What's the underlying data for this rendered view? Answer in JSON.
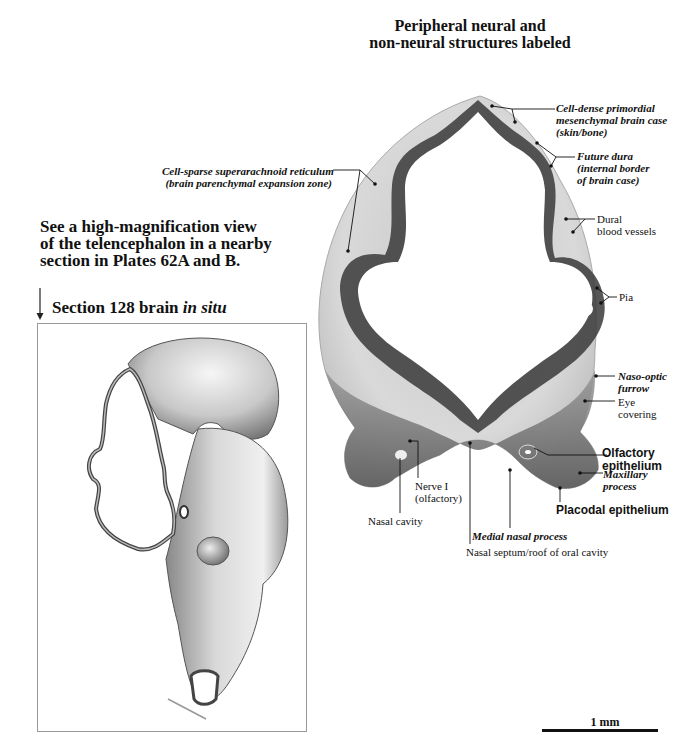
{
  "figure": {
    "title_line1": "Peripheral neural and",
    "title_line2": "non-neural structures labeled",
    "note_line1": "See a high-magnification view",
    "note_line2": "of the telencephalon in a nearby",
    "note_line3": "section in Plates 62A and B.",
    "inset": {
      "label_prefix": "Section 128 brain ",
      "label_italic": "in situ"
    },
    "scale_bar": {
      "label": "1 mm"
    }
  },
  "labels": {
    "cell_dense_1": "Cell-dense primordial",
    "cell_dense_2": "mesenchymal brain case",
    "cell_dense_3": "(skin/bone)",
    "future_dura_1": "Future dura",
    "future_dura_2": "(internal border",
    "future_dura_3": "of brain case)",
    "cell_sparse_1": "Cell-sparse superarachnoid reticulum",
    "cell_sparse_2": "(brain parenchymal expansion zone)",
    "dural_1": "Dural",
    "dural_2": "blood vessels",
    "pia": "Pia",
    "naso_optic_1": "Naso-optic",
    "naso_optic_2": "furrow",
    "eye_1": "Eye",
    "eye_2": "covering",
    "olfactory_1": "Olfactory",
    "olfactory_2": "epithelium",
    "maxillary_1": "Maxillary",
    "maxillary_2": "process",
    "placodal": "Placodal epithelium",
    "nerve_1": "Nerve I",
    "nerve_2": "(olfactory)",
    "nasal_cavity": "Nasal cavity",
    "medial_nasal": "Medial nasal process",
    "nasal_septum": "Nasal septum/roof of oral cavity"
  }
}
